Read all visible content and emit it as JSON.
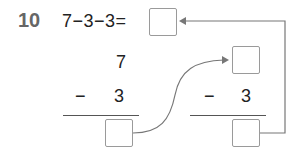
{
  "problem": {
    "number": "10",
    "expression": "7−3−3=",
    "answer_box": ""
  },
  "left_column": {
    "top": "7",
    "operator": "−",
    "subtrahend": "3",
    "result_box": ""
  },
  "right_column": {
    "top_box": "",
    "operator": "−",
    "subtrahend": "3",
    "result_box": ""
  },
  "colors": {
    "arrow": "#777777",
    "box_border": "#9a9a9a",
    "number": "#666666"
  }
}
